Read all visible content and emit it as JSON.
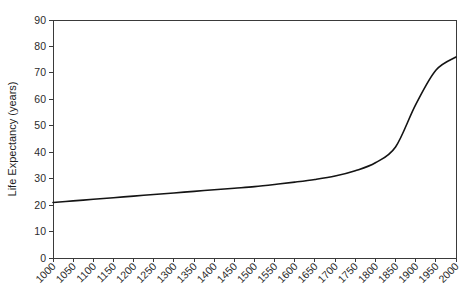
{
  "chart_data": {
    "type": "line",
    "title": "",
    "xlabel": "",
    "ylabel": "Life Expectancy (years)",
    "xlim": [
      1000,
      2000
    ],
    "ylim": [
      0,
      90
    ],
    "grid": false,
    "legend": null,
    "x_tick_labels": [
      "1000",
      "1050",
      "1100",
      "1150",
      "1200",
      "1250",
      "1300",
      "1350",
      "1400",
      "1450",
      "1500",
      "1550",
      "1600",
      "1650",
      "1700",
      "1750",
      "1800",
      "1850",
      "1900",
      "1950",
      "2000"
    ],
    "y_tick_labels": [
      "0",
      "10",
      "20",
      "30",
      "40",
      "50",
      "60",
      "70",
      "80",
      "90"
    ],
    "x_ticks": [
      1000,
      1050,
      1100,
      1150,
      1200,
      1250,
      1300,
      1350,
      1400,
      1450,
      1500,
      1550,
      1600,
      1650,
      1700,
      1750,
      1800,
      1850,
      1900,
      1950,
      2000
    ],
    "y_ticks": [
      0,
      10,
      20,
      30,
      40,
      50,
      60,
      70,
      80,
      90
    ],
    "series": [
      {
        "name": "Life Expectancy",
        "color": "#141414",
        "x": [
          1000,
          1050,
          1100,
          1150,
          1200,
          1250,
          1300,
          1350,
          1400,
          1450,
          1500,
          1550,
          1600,
          1650,
          1700,
          1750,
          1800,
          1850,
          1900,
          1950,
          2000
        ],
        "values": [
          21.0,
          21.6,
          22.2,
          22.8,
          23.4,
          24.0,
          24.6,
          25.2,
          25.8,
          26.4,
          27.0,
          27.8,
          28.7,
          29.7,
          31.0,
          33.0,
          36.0,
          42.0,
          58.0,
          71.0,
          76.0
        ]
      }
    ]
  },
  "axis": {
    "y_title": "Life Expectancy (years)"
  }
}
